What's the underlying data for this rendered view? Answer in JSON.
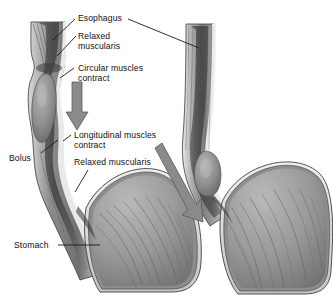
{
  "figure": {
    "title_visible": false,
    "background_color": "#ffffff",
    "ink_color": "#111111",
    "panels": [
      {
        "name": "left-panel",
        "stage": "bolus in mid esophagus, circular muscles contracting above bolus",
        "bolus_present": true
      },
      {
        "name": "right-panel",
        "stage": "bolus near lower esophageal sphincter entering stomach",
        "bolus_present": true
      }
    ]
  },
  "labels": [
    {
      "id": "esophagus",
      "text": "Esophagus"
    },
    {
      "id": "relaxed-muscularis-top",
      "line1": "Relaxed",
      "line2": "muscularis"
    },
    {
      "id": "circular-muscles",
      "line1": "Circular muscles",
      "line2": "contract"
    },
    {
      "id": "longitudinal-muscles",
      "line1": "Longitudinal muscles",
      "line2": "contract"
    },
    {
      "id": "relaxed-muscularis-low",
      "text": "Relaxed muscularis"
    },
    {
      "id": "bolus",
      "text": "Bolus"
    },
    {
      "id": "stomach",
      "text": "Stomach"
    }
  ],
  "arrows": [
    {
      "id": "circular-contraction-arrow",
      "direction": "down",
      "panel": "left-panel"
    },
    {
      "id": "peristaltic-wave-arrow",
      "direction": "down-right",
      "panel": "right-panel"
    }
  ],
  "colors": {
    "ink": "#111111",
    "arrow_fill": "#8a8a8a",
    "arrow_stroke": "#5f5f5f",
    "muscle_mid": "#9b9b9b",
    "muscle_dark": "#6a6a6a",
    "lumen_dark": "#4a4a4a",
    "serosa_light": "#e6e6e6",
    "bolus_fill": "#8e8e8e",
    "stomach_fill": "#9a9a9a"
  }
}
